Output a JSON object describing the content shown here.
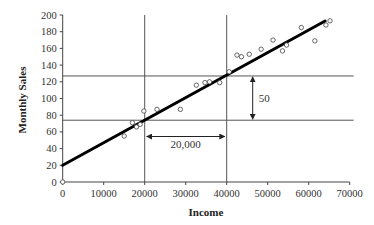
{
  "chart_data": {
    "type": "scatter",
    "title": "",
    "xlabel": "Income",
    "ylabel": "Monthly Sales",
    "xlim": [
      0,
      70000
    ],
    "ylim": [
      0,
      200
    ],
    "x_ticks": [
      0,
      10000,
      20000,
      30000,
      40000,
      50000,
      60000,
      70000
    ],
    "x_tick_labels": [
      "0",
      "10000",
      "20000",
      "30000",
      "40000",
      "50000",
      "60000",
      "70000"
    ],
    "y_ticks": [
      0,
      20,
      40,
      60,
      80,
      100,
      120,
      140,
      160,
      180,
      200
    ],
    "y_tick_labels": [
      "0",
      "20",
      "40",
      "60",
      "80",
      "100",
      "120",
      "140",
      "160",
      "180",
      "200"
    ],
    "grid": false,
    "legend": null,
    "series": [
      {
        "name": "Observations",
        "marker": "open-circle",
        "points": [
          [
            0,
            0
          ],
          [
            15000,
            55
          ],
          [
            17000,
            71
          ],
          [
            18000,
            66
          ],
          [
            18900,
            69
          ],
          [
            19800,
            85
          ],
          [
            23000,
            87
          ],
          [
            28700,
            87
          ],
          [
            32600,
            116
          ],
          [
            34700,
            119
          ],
          [
            35800,
            120
          ],
          [
            38300,
            119
          ],
          [
            40600,
            132
          ],
          [
            42500,
            152
          ],
          [
            43600,
            150
          ],
          [
            45500,
            153
          ],
          [
            48400,
            159
          ],
          [
            51300,
            170
          ],
          [
            53600,
            157
          ],
          [
            54600,
            164
          ],
          [
            58200,
            185
          ],
          [
            61500,
            169
          ],
          [
            64200,
            188
          ],
          [
            65200,
            193
          ]
        ]
      },
      {
        "name": "Regression line",
        "type": "line",
        "intercept": 20,
        "slope": 0.0027,
        "x_range": [
          0,
          64000
        ]
      }
    ],
    "reference_lines": {
      "vertical_x": [
        20000,
        40000
      ],
      "horizontal_y": [
        74,
        127
      ]
    },
    "annotations": [
      {
        "text": "20,000",
        "type": "horizontal-double-arrow",
        "from_x": 20000,
        "to_x": 40000,
        "y": 55
      },
      {
        "text": "50",
        "type": "vertical-double-arrow",
        "x": 46000,
        "from_y": 74,
        "to_y": 127
      }
    ]
  }
}
